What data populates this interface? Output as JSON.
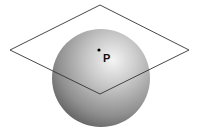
{
  "diagram": {
    "point_label": "P",
    "colors": {
      "background": "#ffffff",
      "plane_stroke": "#333333",
      "sphere_highlight": "#f2f2f2",
      "sphere_mid": "#a8a8a8",
      "sphere_shadow": "#5e5e5e",
      "point": "#000000"
    }
  }
}
